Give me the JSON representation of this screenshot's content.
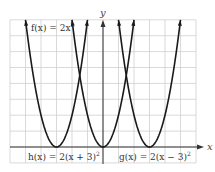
{
  "chart_data": {
    "type": "line",
    "title": "",
    "xlabel": "x",
    "ylabel": "y",
    "xlim": [
      -6,
      6
    ],
    "ylim": [
      -1,
      8
    ],
    "grid": true,
    "grid_step": 1,
    "legend": "inline labels",
    "series": [
      {
        "name": "f(x) = 2x²",
        "label": "f(x) = 2x",
        "label_sup": "2",
        "vertex": [
          0,
          0
        ],
        "a": 2,
        "h": 0,
        "x": [
          -2,
          -1.5,
          -1,
          -0.5,
          0,
          0.5,
          1,
          1.5,
          2
        ],
        "values": [
          8,
          4.5,
          2,
          0.5,
          0,
          0.5,
          2,
          4.5,
          8
        ]
      },
      {
        "name": "h(x) = 2(x + 3)²",
        "label": "h(x) = 2(x + 3)",
        "label_sup": "2",
        "vertex": [
          -3,
          0
        ],
        "a": 2,
        "h": -3,
        "x": [
          -5,
          -4.5,
          -4,
          -3.5,
          -3,
          -2.5,
          -2,
          -1.5,
          -1
        ],
        "values": [
          8,
          4.5,
          2,
          0.5,
          0,
          0.5,
          2,
          4.5,
          8
        ]
      },
      {
        "name": "g(x) = 2(x − 3)²",
        "label": "g(x) = 2(x − 3)",
        "label_sup": "2",
        "vertex": [
          3,
          0
        ],
        "a": 2,
        "h": 3,
        "x": [
          1,
          1.5,
          2,
          2.5,
          3,
          3.5,
          4,
          4.5,
          5
        ],
        "values": [
          8,
          4.5,
          2,
          0.5,
          0,
          0.5,
          2,
          4.5,
          8
        ]
      }
    ]
  },
  "labels": {
    "x_axis": "x",
    "y_axis": "y",
    "f": "f(x) = 2x",
    "f_sup": "2",
    "h": "h(x) = 2(x + 3)",
    "h_sup": "2",
    "g": "g(x) = 2(x − 3)",
    "g_sup": "2"
  },
  "colors": {
    "curve": "#1a1a1a",
    "axis": "#333333",
    "grid": "#cfcfcf",
    "background": "#ffffff"
  }
}
